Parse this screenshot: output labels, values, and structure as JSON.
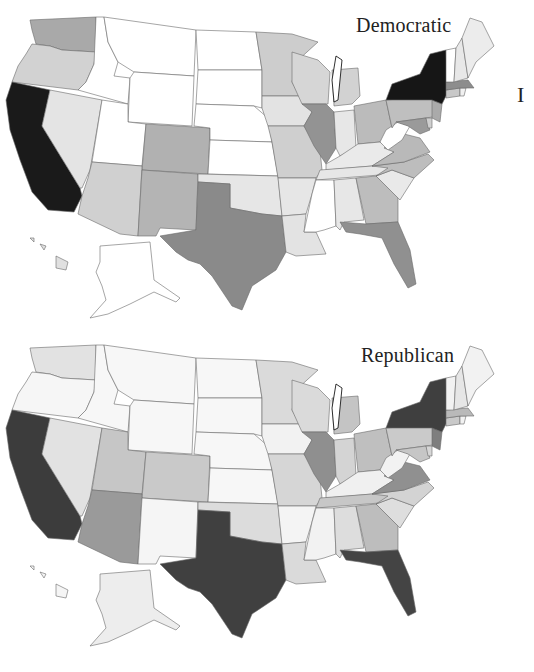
{
  "maps": [
    {
      "id": "dem",
      "title": "Democratic",
      "shades": {
        "CA": "#1a1a1a",
        "NY": "#161616",
        "TX": "#8a8a8a",
        "FL": "#909090",
        "IL": "#939393",
        "WA": "#a9a9a9",
        "OR": "#d2d2d2",
        "NV": "#e4e4e4",
        "AZ": "#d0d0d0",
        "NM": "#b4b4b4",
        "CO": "#b1b1b1",
        "ID": "#ffffff",
        "MT": "#ffffff",
        "WY": "#ffffff",
        "UT": "#ffffff",
        "ND": "#ffffff",
        "SD": "#ffffff",
        "NE": "#ffffff",
        "KS": "#ffffff",
        "OK": "#e6e6e6",
        "MN": "#cdcdcd",
        "IA": "#e3e3e3",
        "MO": "#cfcfcf",
        "AR": "#e6e6e6",
        "LA": "#e3e3e3",
        "WI": "#d6d6d6",
        "MI": "#d2d2d2",
        "IN": "#e7e7e7",
        "OH": "#bbbbbb",
        "KY": "#eaeaea",
        "TN": "#e6e6e6",
        "MS": "#ffffff",
        "AL": "#e7e7e7",
        "GA": "#bdbdbd",
        "SC": "#e9e9e9",
        "NC": "#bdbdbd",
        "VA": "#b9b9b9",
        "WV": "#ffffff",
        "PA": "#bfbfbf",
        "MD": "#9a9a9a",
        "NJ": "#aaaaaa",
        "DE": "#cfcfcf",
        "CT": "#c8c8c8",
        "RI": "#f0f0f0",
        "MA": "#8d8d8d",
        "VT": "#ffffff",
        "NH": "#e8e8e8",
        "ME": "#ececec",
        "AK": "#ffffff",
        "HI": "#e0e0e0"
      }
    },
    {
      "id": "rep",
      "title": "Republican",
      "shades": {
        "CA": "#3c3c3c",
        "NY": "#3f3f3f",
        "TX": "#404040",
        "FL": "#444444",
        "IL": "#8f8f8f",
        "WA": "#e2e2e2",
        "OR": "#f6f6f6",
        "NV": "#e2e2e2",
        "AZ": "#9a9a9a",
        "NM": "#f5f5f5",
        "CO": "#c9c9c9",
        "UT": "#c6c6c6",
        "ID": "#f7f7f7",
        "MT": "#f7f7f7",
        "WY": "#f7f7f7",
        "ND": "#f7f7f7",
        "SD": "#f7f7f7",
        "NE": "#f7f7f7",
        "KS": "#f7f7f7",
        "OK": "#dcdcdc",
        "MN": "#dadada",
        "IA": "#f2f2f2",
        "MO": "#d6d6d6",
        "AR": "#f4f4f4",
        "LA": "#dadada",
        "WI": "#dadada",
        "MI": "#c4c4c4",
        "IN": "#d4d4d4",
        "OH": "#bfbfbf",
        "KY": "#f0f0f0",
        "TN": "#c7c7c7",
        "MS": "#f2f2f2",
        "AL": "#dddddd",
        "GA": "#bdbdbd",
        "SC": "#dedede",
        "NC": "#d3d3d3",
        "VA": "#909090",
        "WV": "#f2f2f2",
        "PA": "#cacaca",
        "MD": "#c6c6c6",
        "NJ": "#7e7e7e",
        "DE": "#d6d6d6",
        "CT": "#c9c9c9",
        "RI": "#f2f2f2",
        "MA": "#b9b9b9",
        "VT": "#f2f2f2",
        "NH": "#e6e6e6",
        "ME": "#f2f2f2",
        "AK": "#ededed",
        "HI": "#f5f5f5"
      }
    }
  ],
  "side_mark": "I"
}
